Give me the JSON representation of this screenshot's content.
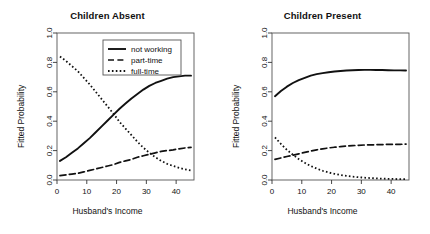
{
  "figure": {
    "background": "#ffffff",
    "foreground": "#111111",
    "panel_count": 2
  },
  "panels": [
    {
      "id": "children-absent",
      "title": "Children Absent",
      "has_legend": true
    },
    {
      "id": "children-present",
      "title": "Children Present",
      "has_legend": false
    }
  ],
  "legend": {
    "position": "top-center-inside",
    "entries": [
      {
        "label": "not working",
        "style": "solid"
      },
      {
        "label": "part-time",
        "style": "dashed"
      },
      {
        "label": "full-time",
        "style": "dotted"
      }
    ]
  },
  "chart_data": [
    {
      "type": "line",
      "title": "Children Absent",
      "xlabel": "Husband's Income",
      "ylabel": "Fitted Probability",
      "xlim": [
        0,
        46
      ],
      "ylim": [
        0.0,
        1.0
      ],
      "xticks": [
        0,
        10,
        20,
        30,
        40
      ],
      "yticks": [
        0.0,
        0.2,
        0.4,
        0.6,
        0.8,
        1.0
      ],
      "xticklabels": [
        "0",
        "10",
        "20",
        "30",
        "40"
      ],
      "yticklabels": [
        "0.0",
        "0.2",
        "0.4",
        "0.6",
        "0.8",
        "1.0"
      ],
      "grid": false,
      "legend": [
        "not working",
        "part-time",
        "full-time"
      ],
      "legend_position": "upper center inside",
      "x": [
        1,
        3,
        5,
        7,
        9,
        11,
        13,
        15,
        17,
        19,
        21,
        23,
        25,
        27,
        29,
        31,
        33,
        35,
        37,
        39,
        41,
        43,
        45
      ],
      "series": [
        {
          "name": "not working",
          "style": "solid",
          "values": [
            0.13,
            0.155,
            0.185,
            0.215,
            0.25,
            0.285,
            0.325,
            0.365,
            0.405,
            0.445,
            0.485,
            0.52,
            0.555,
            0.585,
            0.615,
            0.64,
            0.66,
            0.675,
            0.69,
            0.7,
            0.705,
            0.71,
            0.71
          ]
        },
        {
          "name": "part-time",
          "style": "dashed",
          "values": [
            0.03,
            0.035,
            0.04,
            0.045,
            0.055,
            0.065,
            0.075,
            0.085,
            0.095,
            0.105,
            0.12,
            0.13,
            0.14,
            0.155,
            0.165,
            0.175,
            0.185,
            0.195,
            0.2,
            0.205,
            0.212,
            0.218,
            0.222
          ]
        },
        {
          "name": "full-time",
          "style": "dotted",
          "values": [
            0.84,
            0.81,
            0.775,
            0.74,
            0.695,
            0.65,
            0.6,
            0.55,
            0.5,
            0.45,
            0.395,
            0.35,
            0.305,
            0.26,
            0.22,
            0.185,
            0.155,
            0.13,
            0.11,
            0.095,
            0.083,
            0.072,
            0.065
          ]
        }
      ]
    },
    {
      "type": "line",
      "title": "Children Present",
      "xlabel": "Husband's Income",
      "ylabel": "Fitted Probability",
      "xlim": [
        0,
        46
      ],
      "ylim": [
        0.0,
        1.0
      ],
      "xticks": [
        0,
        10,
        20,
        30,
        40
      ],
      "yticks": [
        0.0,
        0.2,
        0.4,
        0.6,
        0.8,
        1.0
      ],
      "xticklabels": [
        "0",
        "10",
        "20",
        "30",
        "40"
      ],
      "yticklabels": [
        "0.0",
        "0.2",
        "0.4",
        "0.6",
        "0.8",
        "1.0"
      ],
      "grid": false,
      "legend": [],
      "x": [
        1,
        3,
        5,
        7,
        9,
        11,
        13,
        15,
        17,
        19,
        21,
        23,
        25,
        27,
        29,
        31,
        33,
        35,
        37,
        39,
        41,
        43,
        45
      ],
      "series": [
        {
          "name": "not working",
          "style": "solid",
          "values": [
            0.57,
            0.605,
            0.635,
            0.66,
            0.68,
            0.695,
            0.71,
            0.72,
            0.727,
            0.733,
            0.738,
            0.742,
            0.745,
            0.747,
            0.748,
            0.749,
            0.749,
            0.748,
            0.748,
            0.747,
            0.746,
            0.746,
            0.745
          ]
        },
        {
          "name": "part-time",
          "style": "dashed",
          "values": [
            0.14,
            0.15,
            0.16,
            0.168,
            0.178,
            0.188,
            0.197,
            0.205,
            0.212,
            0.218,
            0.223,
            0.227,
            0.231,
            0.234,
            0.236,
            0.238,
            0.239,
            0.24,
            0.241,
            0.242,
            0.243,
            0.243,
            0.244
          ]
        },
        {
          "name": "full-time",
          "style": "dotted",
          "values": [
            0.29,
            0.245,
            0.205,
            0.172,
            0.142,
            0.117,
            0.095,
            0.078,
            0.063,
            0.051,
            0.042,
            0.034,
            0.028,
            0.023,
            0.019,
            0.016,
            0.013,
            0.011,
            0.009,
            0.008,
            0.007,
            0.006,
            0.006
          ]
        }
      ]
    }
  ]
}
